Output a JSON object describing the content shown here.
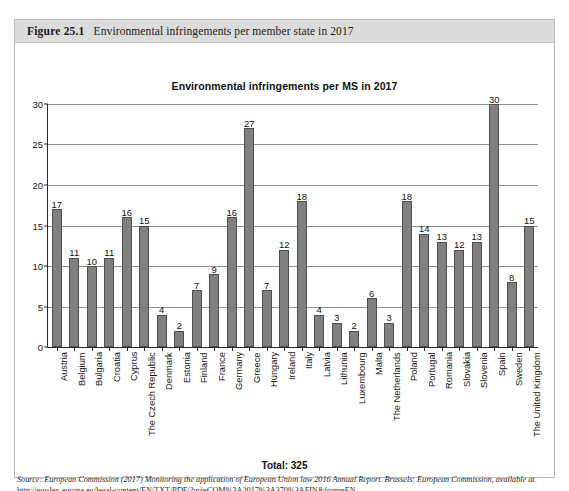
{
  "figure": {
    "number": "Figure 25.1",
    "caption": "Environmental infringements per member state in 2017"
  },
  "total_line": "Total: 325",
  "source": {
    "label": "Source:",
    "text": "European Commission (2017) Monitoring the application of European Union law 2016 Annual Report. Brussels: European Commission, available at",
    "url": "http://eur-lex.europa.eu/legal-content/EN/TXT/PDF/?uri=COM%3A2017%3A370%3AFIN&from=EN"
  },
  "colors": {
    "bar_fill": "#808080",
    "bar_border": "#4f4f4f",
    "header_band": "#dcdcdc",
    "gridline": "#8e8e8e",
    "axis": "#2a2a2a"
  },
  "chart_data": {
    "type": "bar",
    "title": "Environmental infringements per MS in 2017",
    "xlabel": "",
    "ylabel": "",
    "ylim": [
      0,
      30
    ],
    "yticks": [
      0,
      5,
      10,
      15,
      20,
      25,
      30
    ],
    "grid": true,
    "legend": false,
    "data_labels": true,
    "total": 325,
    "categories": [
      "Austria",
      "Belgium",
      "Bulgaria",
      "Croatia",
      "Cyprus",
      "The Czech Republic",
      "Denmark",
      "Estonia",
      "Finland",
      "France",
      "Germany",
      "Greece",
      "Hungary",
      "Ireland",
      "Italy",
      "Latvia",
      "Lithunia",
      "Luxembourg",
      "Malta",
      "The Netherlands",
      "Poland",
      "Portugal",
      "Romania",
      "Slovakia",
      "Slovenia",
      "Spain",
      "Sweden",
      "The United Kingdom"
    ],
    "values": [
      17,
      11,
      10,
      11,
      16,
      15,
      4,
      2,
      7,
      9,
      16,
      27,
      7,
      12,
      18,
      4,
      3,
      2,
      6,
      3,
      18,
      14,
      13,
      12,
      13,
      30,
      8,
      15
    ]
  }
}
